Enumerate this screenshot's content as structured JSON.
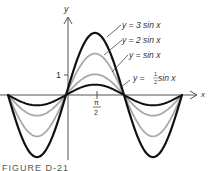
{
  "figure": {
    "caption": "FIGURE D-21",
    "axis_x_label": "x",
    "axis_y_label": "y",
    "y_tick_label": "1",
    "x_tick_label_num": "π",
    "x_tick_label_den": "2",
    "colors": {
      "dark": "#111111",
      "gray": "#a8a8a8",
      "axis": "#444444"
    }
  },
  "chart_data": {
    "type": "line",
    "title": "",
    "xlabel": "x",
    "ylabel": "y",
    "x_range": [
      "-π",
      "2π"
    ],
    "y_ticks": [
      1
    ],
    "x_ticks": [
      "π/2"
    ],
    "series": [
      {
        "name": "y = 3 sin x",
        "label": "y = 3 sin x",
        "amplitude": 3,
        "color": "#111111"
      },
      {
        "name": "y = 2 sin x",
        "label": "y = 2 sin x",
        "amplitude": 2,
        "color": "#a8a8a8"
      },
      {
        "name": "y = sin x",
        "label": "y = sin x",
        "amplitude": 1,
        "color": "#a8a8a8"
      },
      {
        "name": "y = 1/2 sin x",
        "label": "y = ½ sin x",
        "amplitude": 0.5,
        "color": "#111111"
      }
    ]
  },
  "labels": {
    "l3": "y = 3 sin x",
    "l2": "y = 2 sin x",
    "l1": "y = sin x",
    "lh_prefix": "y = ",
    "lh_num": "1",
    "lh_den": "2",
    "lh_suffix": " sin x"
  }
}
